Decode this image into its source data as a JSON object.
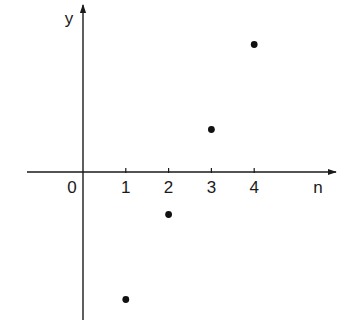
{
  "chart_data": {
    "type": "scatter",
    "title": "",
    "xlabel": "n",
    "ylabel": "y",
    "origin_label": "0",
    "x_ticks": [
      1,
      2,
      3,
      4
    ],
    "x_tick_labels": [
      "1",
      "2",
      "3",
      "4"
    ],
    "y_ticks": [],
    "series": [
      {
        "name": "y(n)",
        "x": [
          1,
          2,
          3,
          4
        ],
        "y": [
          -3,
          -1,
          1,
          3
        ]
      }
    ],
    "xlim": [
      -1.3,
      6.0
    ],
    "ylim": [
      -3.5,
      4.0
    ],
    "grid": false,
    "legend": null,
    "axes_style": "arrows-through-origin",
    "point_color": "#111111",
    "axis_color": "#1a1a1a"
  }
}
